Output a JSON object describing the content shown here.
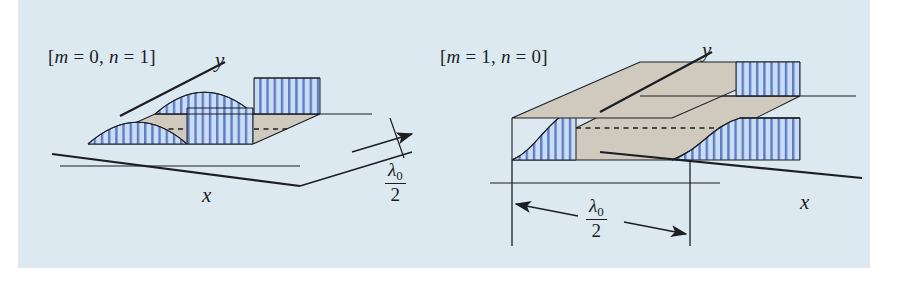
{
  "figure": {
    "background_color": "#dde9f0",
    "page_color": "#ffffff",
    "ink_color": "#1b1f24",
    "floor_color": "#cfcabd",
    "hatch_color": "#4a6fc0",
    "hatch_fill": "#c9d9f0"
  },
  "panels": [
    {
      "id": "left",
      "mode_label": "[m = 0, n = 1]",
      "mode_label_parts": {
        "open_bracket": "[",
        "m_symbol": "m",
        "eq1": " = ",
        "m_value": "0",
        "comma": ", ",
        "n_symbol": "n",
        "eq2": " = ",
        "n_value": "1",
        "close_bracket": "]"
      },
      "axis_x_label": "x",
      "axis_y_label": "y",
      "dimension": {
        "numerator_symbol": "λ",
        "numerator_subscript": "0",
        "denominator": "2",
        "text": "λ0/2"
      }
    },
    {
      "id": "right",
      "mode_label": "[m = 1, n = 0]",
      "mode_label_parts": {
        "open_bracket": "[",
        "m_symbol": "m",
        "eq1": " = ",
        "m_value": "1",
        "comma": ", ",
        "n_symbol": "n",
        "eq2": " = ",
        "n_value": "0",
        "close_bracket": "]"
      },
      "axis_x_label": "x",
      "axis_y_label": "y",
      "dimension": {
        "numerator_symbol": "λ",
        "numerator_subscript": "0",
        "denominator": "2",
        "text": "λ0/2"
      }
    }
  ]
}
